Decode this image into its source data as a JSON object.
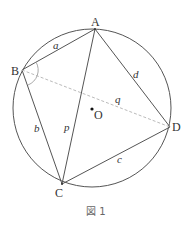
{
  "figure": {
    "caption": "図 1",
    "circle": {
      "center_label": "O",
      "cx": 92,
      "cy": 108,
      "r": 79
    },
    "points": {
      "A": {
        "label": "A",
        "x": 95,
        "y": 29
      },
      "B": {
        "label": "B",
        "x": 22,
        "y": 70
      },
      "C": {
        "label": "C",
        "x": 62,
        "y": 184
      },
      "D": {
        "label": "D",
        "x": 170,
        "y": 127
      }
    },
    "segments": {
      "AB": "a",
      "BC": "b",
      "CD": "c",
      "DA": "d",
      "AC": "p",
      "BD": "q"
    },
    "colors": {
      "stroke": "#555555",
      "dashed": "#bbbbbb",
      "angle_arc": "#aaaaaa"
    }
  }
}
